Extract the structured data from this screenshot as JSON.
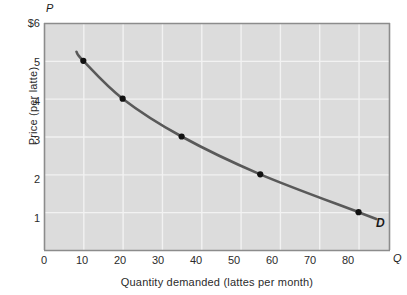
{
  "chart_data": {
    "type": "line",
    "title": "",
    "subtitle": "",
    "xlabel": "Quantity demanded (lattes per month)",
    "ylabel": "Price (per latte)",
    "x_axis_variable": "Q",
    "y_axis_variable": "P",
    "xlim": [
      0,
      88
    ],
    "ylim": [
      0,
      6
    ],
    "grid": true,
    "legend_position": "inline-curve-end",
    "x_ticks": [
      "0",
      "10",
      "20",
      "30",
      "40",
      "50",
      "60",
      "70",
      "80"
    ],
    "x_tick_values": [
      0,
      10,
      20,
      30,
      40,
      50,
      60,
      70,
      80
    ],
    "y_ticks": [
      "$6",
      "5",
      "4",
      "3",
      "2",
      "1"
    ],
    "y_tick_values": [
      6,
      5,
      4,
      3,
      2,
      1
    ],
    "series": [
      {
        "name": "D",
        "label": "D",
        "color": "#595959",
        "marker_color": "#111111",
        "x": [
          10,
          20,
          35,
          55,
          80
        ],
        "y": [
          5,
          4,
          3,
          2,
          1
        ],
        "points": [
          {
            "q": 10,
            "p": 5
          },
          {
            "q": 20,
            "p": 4
          },
          {
            "q": 35,
            "p": 3
          },
          {
            "q": 55,
            "p": 2
          },
          {
            "q": 80,
            "p": 1
          }
        ]
      }
    ],
    "annotations": [
      {
        "text": "D",
        "x": 86,
        "y": 0.92,
        "style": "bold-italic"
      }
    ],
    "colors": {
      "plot_background": "#dcdcdc",
      "gridline": "#f2f2f2",
      "axis": "#8c8c8c",
      "curve": "#595959",
      "marker": "#111111",
      "text": "#2b2b2b",
      "page_background": "#ffffff"
    }
  }
}
